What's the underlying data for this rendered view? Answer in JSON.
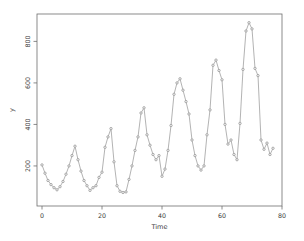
{
  "figure": {
    "background": "#ffffff",
    "axis_color": "#6e6e6e",
    "label_color": "#3a3a3a",
    "series_color": "#9a9a9a",
    "marker_fill": "#f2f2f2"
  },
  "chart_data": {
    "type": "line",
    "title": "",
    "xlabel": "Time",
    "ylabel": "y",
    "legend": "none",
    "grid": false,
    "marker": "small-open-circle",
    "line_style": "solid-thin",
    "x_ticks": [
      0,
      20,
      40,
      60,
      80
    ],
    "y_ticks": [
      200,
      400,
      600,
      800
    ],
    "xlim": [
      -1.67,
      80
    ],
    "ylim": [
      7,
      932
    ],
    "x_start": 0,
    "x_step": 1,
    "values": [
      205,
      165,
      130,
      110,
      95,
      85,
      100,
      125,
      160,
      200,
      250,
      295,
      230,
      175,
      130,
      105,
      82,
      95,
      105,
      145,
      170,
      290,
      340,
      380,
      220,
      105,
      78,
      72,
      75,
      135,
      200,
      275,
      340,
      455,
      480,
      350,
      300,
      255,
      230,
      250,
      150,
      185,
      275,
      395,
      545,
      600,
      620,
      565,
      510,
      450,
      325,
      250,
      200,
      180,
      200,
      350,
      470,
      685,
      710,
      660,
      615,
      400,
      305,
      325,
      255,
      230,
      405,
      665,
      850,
      890,
      860,
      670,
      635,
      325,
      280,
      310,
      255,
      285
    ]
  }
}
